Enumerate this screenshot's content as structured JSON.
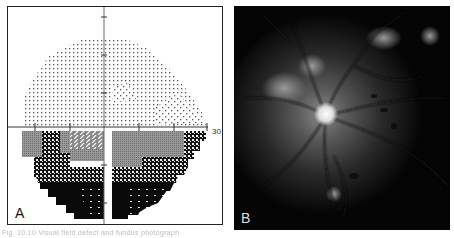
{
  "figure": {
    "caption": "Fig. 10.10  Visual field defect and fundus photograph"
  },
  "panel_a": {
    "label": "A",
    "axis_label": "30",
    "description": "visual field plot with inferior altitudinal defect",
    "colors": {
      "dots": "#555555",
      "gray": "#8a8a8a",
      "dark": "#0a0a0a",
      "border": "#222222"
    }
  },
  "panel_b": {
    "label": "B",
    "description": "fundus photograph with optic disc swelling and hemorrhages",
    "colors": {
      "background": "#050505",
      "disc": "#f2f2f2",
      "glow": "#6a6a6a"
    }
  }
}
